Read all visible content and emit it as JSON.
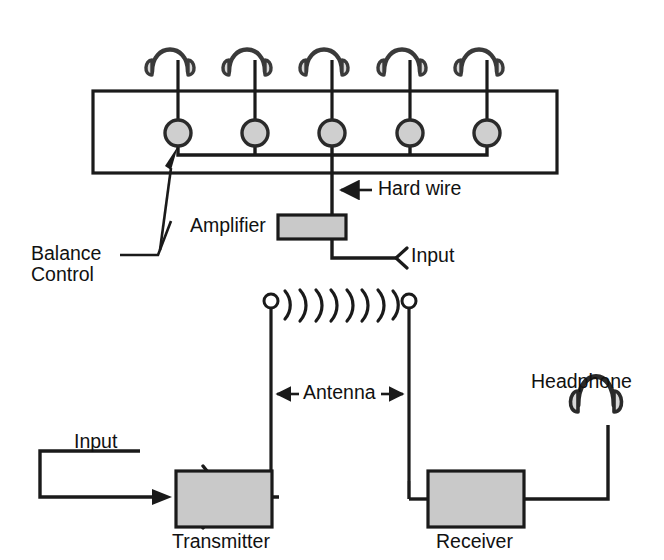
{
  "diagram": {
    "stroke_color": "#1a1a1a",
    "box_fill_color": "#c9c9c9",
    "knob_fill_color": "#cfcfcf",
    "earcup_fill_color": "#d8d8d8",
    "background_color": "#ffffff"
  },
  "hardwire_system": {
    "enclosure": {
      "label": ""
    },
    "headphone_count": 5,
    "knob_count": 5,
    "labels": {
      "balance_control_line1": "Balance",
      "balance_control_line2": "Control",
      "hard_wire": "Hard wire",
      "amplifier": "Amplifier",
      "input": "Input"
    }
  },
  "wireless_system": {
    "radio_wave_arc_count": 8,
    "labels": {
      "input": "Input",
      "transmitter": "Transmitter",
      "antenna": "Antenna",
      "receiver": "Receiver",
      "headphone": "Headphone"
    }
  }
}
